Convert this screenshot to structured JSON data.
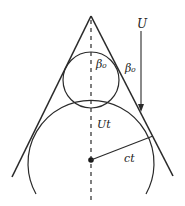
{
  "diagram": {
    "colors": {
      "stroke": "#2a2a2a",
      "background": "#ffffff"
    },
    "labels": {
      "velocity": "U",
      "angle_inner": "β₀",
      "angle_outer": "β₀",
      "displacement": "Ut",
      "radius": "ct"
    },
    "elements": [
      "wedge-left-edge",
      "wedge-right-edge",
      "symmetry-axis-dashed",
      "small-circle",
      "large-circle-arc",
      "center-dot",
      "radius-line",
      "velocity-arrow"
    ]
  }
}
